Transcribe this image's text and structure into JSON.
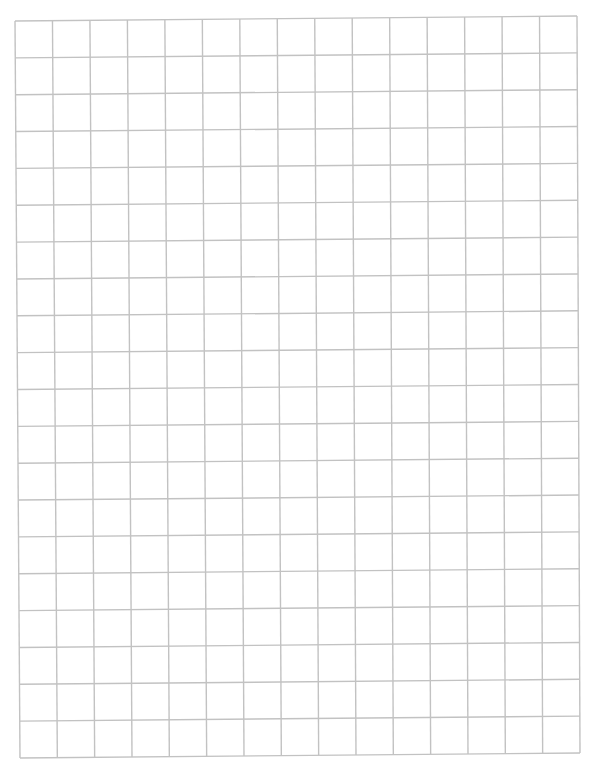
{
  "page": {
    "type": "graph-paper",
    "background": "#ffffff",
    "line_color": "#c2c2c2",
    "line_width": 1.4
  },
  "grid": {
    "columns": 15,
    "rows": 20,
    "corners": {
      "top_left": [
        15,
        21
      ],
      "top_right": [
        577,
        16
      ],
      "bottom_right": [
        580,
        753
      ],
      "bottom_left": [
        20,
        758
      ]
    }
  }
}
